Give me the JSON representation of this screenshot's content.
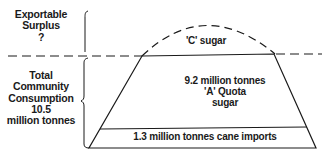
{
  "labels": {
    "exportable_surplus": [
      "Exportable",
      "Surplus",
      "?"
    ],
    "total_consumption": [
      "Total",
      "Community",
      "Consumption",
      "10.5",
      "million tonnes"
    ],
    "c_sugar": "'C' sugar",
    "a_quota": [
      "9.2 million tonnes",
      "'A' Quota",
      "sugar"
    ],
    "cane_imports": "1.3 million tonnes cane imports"
  },
  "colors": {
    "line": "#1a1a1a",
    "background": "#ffffff"
  }
}
